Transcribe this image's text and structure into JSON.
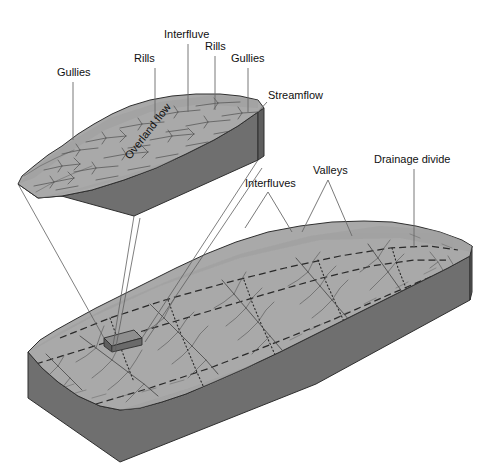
{
  "figure": {
    "background_color": "#ffffff",
    "colors": {
      "top_surface": "#a9a9a9",
      "top_surface_shadow": "#9a9a9a",
      "side_face_front": "#6f6f6f",
      "side_face_right": "#5e5e5e",
      "outline": "#2f2f2f",
      "leader_line": "#6a6a6a",
      "projection_line": "#5e5e5e",
      "stream_line": "#4a4a4a",
      "divide_line": "#2a2a2a",
      "label_text": "#101010"
    }
  },
  "upper_block": {
    "name": "magnified hillslope block",
    "surface_label": "Overland flow",
    "labels": [
      {
        "id": "gullies-left",
        "text": "Gullies",
        "x": 57,
        "y": 76,
        "anchor": "start"
      },
      {
        "id": "rills-left",
        "text": "Rills",
        "x": 134,
        "y": 62,
        "anchor": "start"
      },
      {
        "id": "interfluve",
        "text": "Interfluve",
        "x": 164,
        "y": 38,
        "anchor": "start"
      },
      {
        "id": "rills-right",
        "text": "Rills",
        "x": 205,
        "y": 50,
        "anchor": "start"
      },
      {
        "id": "gullies-right",
        "text": "Gullies",
        "x": 231,
        "y": 62,
        "anchor": "start"
      },
      {
        "id": "streamflow",
        "text": "Streamflow",
        "x": 268,
        "y": 99,
        "anchor": "start"
      }
    ]
  },
  "lower_block": {
    "name": "drainage basin block",
    "labels": [
      {
        "id": "interfluves",
        "text": "Interfluves",
        "x": 245,
        "y": 187,
        "anchor": "start"
      },
      {
        "id": "valleys",
        "text": "Valleys",
        "x": 313,
        "y": 174,
        "anchor": "start"
      },
      {
        "id": "drainage-divide",
        "text": "Drainage divide",
        "x": 374,
        "y": 163,
        "anchor": "start"
      }
    ],
    "inset_box_label": "magnified area"
  }
}
